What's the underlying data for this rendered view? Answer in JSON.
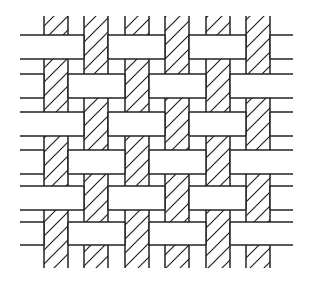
{
  "diagram": {
    "type": "plain-weave",
    "colors": {
      "background": "#ffffff",
      "stroke": "#222222",
      "warp_fill": "#ffffff",
      "weft_fill": "#ffffff"
    },
    "stroke_width": 1.5,
    "hatch": {
      "angle_deg": 45,
      "spacing": 14
    },
    "extent": {
      "left": 20,
      "right": 293,
      "top": 16,
      "bottom": 268
    },
    "warps": [
      {
        "x1": 44,
        "x2": 68
      },
      {
        "x1": 84,
        "x2": 108
      },
      {
        "x1": 125,
        "x2": 149
      },
      {
        "x1": 165,
        "x2": 189
      },
      {
        "x1": 206,
        "x2": 230
      },
      {
        "x1": 246,
        "x2": 270
      }
    ],
    "wefts": [
      {
        "y1": 35,
        "y2": 59
      },
      {
        "y1": 74,
        "y2": 98
      },
      {
        "y1": 112,
        "y2": 136
      },
      {
        "y1": 150,
        "y2": 174
      },
      {
        "y1": 186,
        "y2": 210
      },
      {
        "y1": 222,
        "y2": 245
      }
    ],
    "interlacing": [
      [
        "weft",
        "warp",
        "weft",
        "warp",
        "weft",
        "warp"
      ],
      [
        "warp",
        "weft",
        "warp",
        "weft",
        "warp",
        "weft"
      ],
      [
        "weft",
        "warp",
        "weft",
        "warp",
        "weft",
        "warp"
      ],
      [
        "warp",
        "weft",
        "warp",
        "weft",
        "warp",
        "weft"
      ],
      [
        "weft",
        "warp",
        "weft",
        "warp",
        "weft",
        "warp"
      ],
      [
        "warp",
        "weft",
        "warp",
        "weft",
        "warp",
        "weft"
      ]
    ]
  }
}
